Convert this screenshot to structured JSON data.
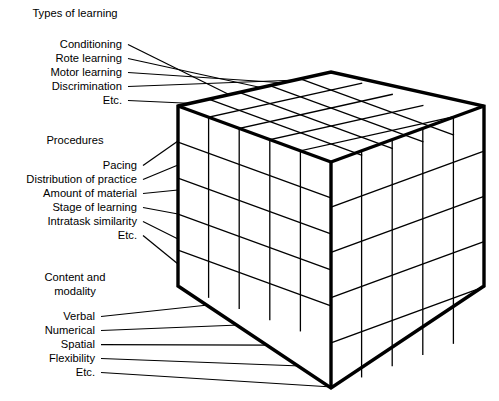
{
  "figure": {
    "type": "three-dimensional-matrix-cube",
    "background_color": "#ffffff",
    "line_color": "#000000"
  },
  "groups": [
    {
      "id": "types-of-learning",
      "heading": "Types of learning",
      "heading_pos": {
        "x": 75,
        "y": 17
      },
      "items": [
        {
          "label": "Conditioning",
          "text_x": 122,
          "text_y": 48,
          "leader_to_x": 236,
          "leader_to_y": 98
        },
        {
          "label": "Rote learning",
          "text_x": 122,
          "text_y": 62,
          "leader_to_x": 272,
          "leader_to_y": 90
        },
        {
          "label": "Motor learning",
          "text_x": 122,
          "text_y": 76,
          "leader_to_x": 301,
          "leader_to_y": 84
        },
        {
          "label": "Discrimination",
          "text_x": 122,
          "text_y": 90,
          "leader_to_x": 324,
          "leader_to_y": 79
        },
        {
          "label": "Etc.",
          "text_x": 122,
          "text_y": 104,
          "leader_to_x": 205,
          "leader_to_y": 104
        }
      ]
    },
    {
      "id": "procedures",
      "heading": "Procedures",
      "heading_pos": {
        "x": 75,
        "y": 144
      },
      "items": [
        {
          "label": "Pacing",
          "text_x": 137,
          "text_y": 169,
          "leader_to_x": 178,
          "leader_to_y": 141
        },
        {
          "label": "Distribution of practice",
          "text_x": 137,
          "text_y": 183,
          "leader_to_x": 178,
          "leader_to_y": 165
        },
        {
          "label": "Amount of material",
          "text_x": 137,
          "text_y": 197,
          "leader_to_x": 178,
          "leader_to_y": 190
        },
        {
          "label": "Stage of learning",
          "text_x": 137,
          "text_y": 211,
          "leader_to_x": 178,
          "leader_to_y": 214
        },
        {
          "label": "Intratask similarity",
          "text_x": 137,
          "text_y": 225,
          "leader_to_x": 178,
          "leader_to_y": 239
        },
        {
          "label": "Etc.",
          "text_x": 137,
          "text_y": 239,
          "leader_to_x": 178,
          "leader_to_y": 264
        }
      ]
    },
    {
      "id": "content-and-modality",
      "heading_line1": "Content and",
      "heading_line2": "modality",
      "heading_pos": {
        "x": 75,
        "y": 281
      },
      "heading_pos2": {
        "x": 75,
        "y": 295
      },
      "items": [
        {
          "label": "Verbal",
          "text_x": 95,
          "text_y": 320,
          "leader_to_x": 208,
          "leader_to_y": 305
        },
        {
          "label": "Numerical",
          "text_x": 95,
          "text_y": 334,
          "leader_to_x": 239,
          "leader_to_y": 325
        },
        {
          "label": "Spatial",
          "text_x": 95,
          "text_y": 348,
          "leader_to_x": 270,
          "leader_to_y": 345
        },
        {
          "label": "Flexibility",
          "text_x": 95,
          "text_y": 362,
          "leader_to_x": 301,
          "leader_to_y": 366
        },
        {
          "label": "Etc.",
          "text_x": 95,
          "text_y": 376,
          "leader_to_x": 332,
          "leader_to_y": 387
        }
      ]
    }
  ],
  "cube": {
    "divisions": 5,
    "vertices": {
      "left_top": {
        "x": 178,
        "y": 106
      },
      "back_top": {
        "x": 331,
        "y": 72
      },
      "right_top": {
        "x": 484,
        "y": 106
      },
      "front_top": {
        "x": 331,
        "y": 162
      },
      "left_bottom": {
        "x": 178,
        "y": 286
      },
      "right_bottom": {
        "x": 484,
        "y": 286
      },
      "front_bottom": {
        "x": 331,
        "y": 388
      }
    },
    "faces": [
      {
        "name": "top-face",
        "rows": 5,
        "cols": 5
      },
      {
        "name": "left-face",
        "rows": 5,
        "cols": 5
      },
      {
        "name": "right-face",
        "rows": 5,
        "cols": 5
      }
    ]
  }
}
